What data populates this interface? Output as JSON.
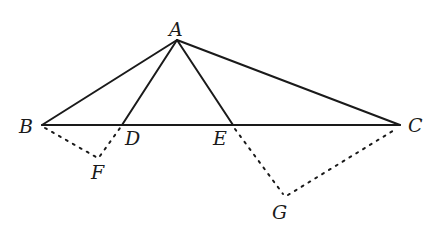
{
  "diagram": {
    "type": "geometry",
    "points": {
      "A": {
        "label": "A",
        "x": 177,
        "y": 40
      },
      "B": {
        "label": "B",
        "x": 42,
        "y": 125
      },
      "C": {
        "label": "C",
        "x": 400,
        "y": 125
      },
      "D": {
        "label": "D",
        "x": 122,
        "y": 125
      },
      "E": {
        "label": "E",
        "x": 233,
        "y": 125
      },
      "F": {
        "label": "F",
        "x": 98,
        "y": 159
      },
      "G": {
        "label": "G",
        "x": 285,
        "y": 197
      }
    },
    "solid_segments": [
      "AB",
      "AC",
      "AD",
      "AE",
      "BC"
    ],
    "dotted_segments": [
      "BF",
      "FD",
      "EG",
      "GC"
    ],
    "colors": {
      "stroke": "#1a1a1a",
      "background": "#ffffff"
    }
  }
}
